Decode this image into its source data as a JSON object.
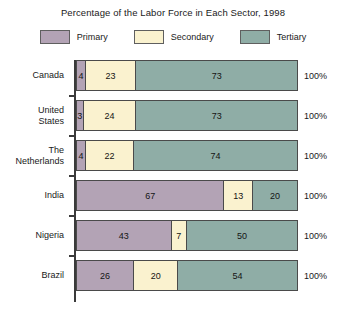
{
  "chart_data": {
    "type": "bar",
    "orientation": "horizontal",
    "stacked": true,
    "title": "Percentage of the Labor Force in Each Sector, 1998",
    "xlabel": "",
    "ylabel": "",
    "xlim": [
      0,
      100
    ],
    "grid": false,
    "legend_position": "top",
    "unit": "%",
    "categories": [
      "Canada",
      "United States",
      "The Netherlands",
      "India",
      "Nigeria",
      "Brazil"
    ],
    "series": [
      {
        "name": "Primary",
        "color": "#b3a3b5",
        "values": [
          4,
          3,
          4,
          67,
          43,
          26
        ]
      },
      {
        "name": "Secondary",
        "color": "#faf2cf",
        "values": [
          23,
          24,
          22,
          13,
          7,
          20
        ]
      },
      {
        "name": "Tertiary",
        "color": "#8fada6",
        "values": [
          73,
          73,
          74,
          20,
          50,
          54
        ]
      }
    ],
    "row_totals": [
      "100%",
      "100%",
      "100%",
      "100%",
      "100%",
      "100%"
    ]
  },
  "legend": {
    "items": [
      {
        "label": "Primary",
        "color": "#b3a3b5"
      },
      {
        "label": "Secondary",
        "color": "#faf2cf"
      },
      {
        "label": "Tertiary",
        "color": "#8fada6"
      }
    ]
  },
  "rows": [
    {
      "label_line1": "Canada",
      "label_line2": "",
      "total": "100%",
      "segments": [
        {
          "label": "4",
          "value": 4,
          "sector": "Primary"
        },
        {
          "label": "23",
          "value": 23,
          "sector": "Secondary"
        },
        {
          "label": "73",
          "value": 73,
          "sector": "Tertiary"
        }
      ]
    },
    {
      "label_line1": "United",
      "label_line2": "States",
      "total": "100%",
      "segments": [
        {
          "label": "3",
          "value": 3,
          "sector": "Primary"
        },
        {
          "label": "24",
          "value": 24,
          "sector": "Secondary"
        },
        {
          "label": "73",
          "value": 73,
          "sector": "Tertiary"
        }
      ]
    },
    {
      "label_line1": "The",
      "label_line2": "Netherlands",
      "total": "100%",
      "segments": [
        {
          "label": "4",
          "value": 4,
          "sector": "Primary"
        },
        {
          "label": "22",
          "value": 22,
          "sector": "Secondary"
        },
        {
          "label": "74",
          "value": 74,
          "sector": "Tertiary"
        }
      ]
    },
    {
      "label_line1": "India",
      "label_line2": "",
      "total": "100%",
      "segments": [
        {
          "label": "67",
          "value": 67,
          "sector": "Primary"
        },
        {
          "label": "13",
          "value": 13,
          "sector": "Secondary"
        },
        {
          "label": "20",
          "value": 20,
          "sector": "Tertiary"
        }
      ]
    },
    {
      "label_line1": "Nigeria",
      "label_line2": "",
      "total": "100%",
      "segments": [
        {
          "label": "43",
          "value": 43,
          "sector": "Primary"
        },
        {
          "label": "7",
          "value": 7,
          "sector": "Secondary"
        },
        {
          "label": "50",
          "value": 50,
          "sector": "Tertiary"
        }
      ]
    },
    {
      "label_line1": "Brazil",
      "label_line2": "",
      "total": "100%",
      "segments": [
        {
          "label": "26",
          "value": 26,
          "sector": "Primary"
        },
        {
          "label": "20",
          "value": 20,
          "sector": "Secondary"
        },
        {
          "label": "54",
          "value": 54,
          "sector": "Tertiary"
        }
      ]
    }
  ]
}
